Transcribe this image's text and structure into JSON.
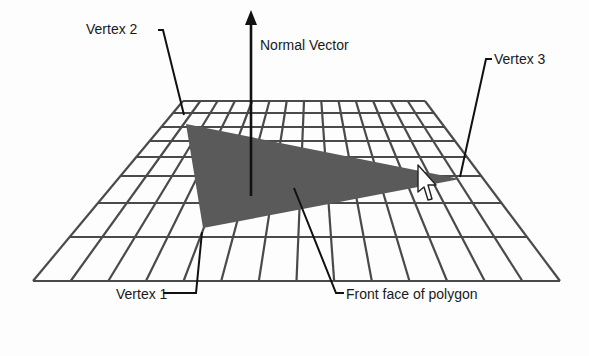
{
  "diagram": {
    "labels": {
      "vertex1": "Vertex 1",
      "vertex2": "Vertex 2",
      "vertex3": "Vertex 3",
      "normal": "Normal Vector",
      "front_face": "Front face of polygon"
    },
    "grid": {
      "columns": 14,
      "rows": 8,
      "top_edge": {
        "x1": 183,
        "x2": 425,
        "y": 101
      },
      "bottom_edge": {
        "x1": 33,
        "x2": 560,
        "y": 281
      },
      "row_y": [
        101,
        113,
        127,
        141,
        157,
        176,
        203,
        237,
        281
      ]
    },
    "polygon": {
      "vertices": [
        [
          203,
          228
        ],
        [
          186,
          124
        ],
        [
          460,
          179
        ]
      ],
      "fill": "#5a5a5a"
    },
    "colors": {
      "grid_line": "#4a4a4a",
      "leader": "#111111",
      "background": "#fdfdfd"
    }
  }
}
